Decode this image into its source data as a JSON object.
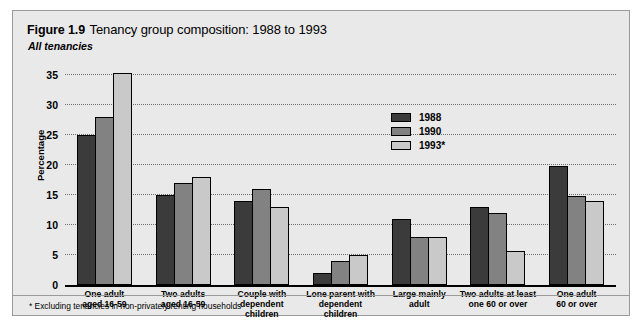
{
  "figure": {
    "number": "Figure 1.9",
    "title": "Tenancy group composition: 1988 to 1993",
    "subtitle": "All tenancies",
    "footnote": "*  Excluding tenancies in non-privately renting households"
  },
  "colors": {
    "series_1988": "#3b3b3b",
    "series_1990": "#828282",
    "series_1993": "#c9c9c9",
    "panel_background": "#e9e9e9",
    "panel_border": "#9a9a9a",
    "gridline": "#6e6e6e",
    "axis": "#000000"
  },
  "chart_data": {
    "type": "bar",
    "title": "Tenancy group composition: 1988 to 1993",
    "subtitle": "All tenancies",
    "xlabel": "",
    "ylabel": "Percentage",
    "ylim": [
      0,
      35
    ],
    "yticks": [
      0,
      5,
      10,
      15,
      20,
      25,
      30,
      35
    ],
    "ytick_labels": [
      "0",
      "5",
      "10",
      "15",
      "20",
      "25",
      "30",
      "35"
    ],
    "grid": true,
    "legend_position": "inside-upper-right",
    "categories": [
      "One adult\naged 16-59",
      "Two adults\naged 16-59",
      "Couple with\ndependent children",
      "Lone parent with\ndependent children",
      "Large mainly\nadult",
      "Two adults at least\none 60 or over",
      "One adult\n60 or over"
    ],
    "category_lines": [
      [
        "One adult",
        "aged 16-59"
      ],
      [
        "Two adults",
        "aged 16-59"
      ],
      [
        "Couple with",
        "dependent children"
      ],
      [
        "Lone parent with",
        "dependent children"
      ],
      [
        "Large mainly",
        "adult"
      ],
      [
        "Two adults at least",
        "one 60 or over"
      ],
      [
        "One adult",
        "60 or over"
      ]
    ],
    "series": [
      {
        "name": "1988",
        "values": [
          25.0,
          15.0,
          14.0,
          2.0,
          11.0,
          13.0,
          19.8
        ]
      },
      {
        "name": "1990",
        "values": [
          28.0,
          17.0,
          16.0,
          4.0,
          8.0,
          12.0,
          14.8
        ]
      },
      {
        "name": "1993*",
        "values": [
          35.3,
          18.0,
          13.0,
          5.0,
          8.0,
          5.7,
          14.0
        ]
      }
    ],
    "annotations": [
      "*  Excluding tenancies in non-privately renting households"
    ]
  }
}
